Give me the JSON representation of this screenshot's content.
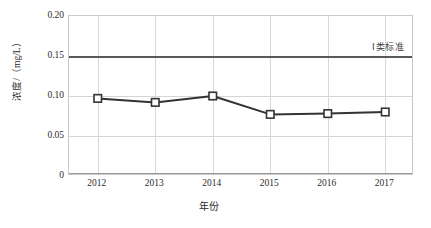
{
  "chart_data": {
    "type": "line",
    "title": "",
    "xlabel": "年份",
    "ylabel": "浓度/（mg/L）",
    "categories": [
      "2012",
      "2013",
      "2014",
      "2015",
      "2016",
      "2017"
    ],
    "series": [
      {
        "name": "浓度",
        "values": [
          0.097,
          0.092,
          0.1,
          0.077,
          0.078,
          0.08
        ],
        "marker": "open-square",
        "color": "#333333"
      }
    ],
    "ylim": [
      0,
      0.2
    ],
    "yticks": [
      "0",
      "0.05",
      "0.10",
      "0.15",
      "0.20"
    ],
    "ytick_values": [
      0,
      0.05,
      0.1,
      0.15,
      0.2
    ],
    "grid": true,
    "grid_color": "#d5d5d5",
    "legend_position": "inline-right",
    "annotations": [
      {
        "name": "class-1-standard",
        "label": "Ⅰ类标准",
        "type": "hline",
        "value": 0.149,
        "color": "#595959"
      }
    ]
  },
  "colors": {
    "series_line": "#333333",
    "marker_fill": "#ffffff",
    "threshold": "#595959",
    "grid": "#d5d5d5",
    "frame": "#c9c9c9",
    "text": "#2b2b2b",
    "background": "#ffffff"
  }
}
